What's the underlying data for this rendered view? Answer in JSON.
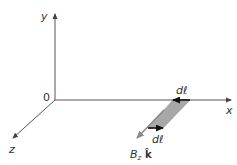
{
  "diagram": {
    "axes": {
      "origin_label": "0",
      "x_label": "x",
      "y_label": "y",
      "z_label": "z"
    },
    "element": {
      "top_arrow_label": "dℓ",
      "bottom_arrow_label": "dℓ",
      "field_label_prefix": "B",
      "field_label_sub": "z",
      "field_label_unit": "k̂"
    },
    "colors": {
      "axis": "#555555",
      "arrow": "#111111",
      "field_arrow": "#8a8a8a",
      "strip_fill": "#a8a8a8"
    }
  }
}
